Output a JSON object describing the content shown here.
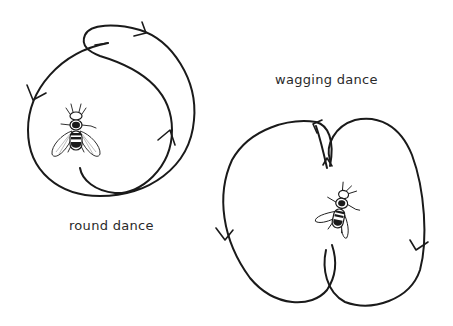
{
  "diagram": {
    "colors": {
      "line": "#1a1a1a",
      "background": "#ffffff",
      "text": "#2a2a2a"
    },
    "panels": [
      {
        "id": "round",
        "label": "round dance",
        "icon": "bee-icon",
        "description": "Circular trail with a reversing loop; arrows indicate alternating circling direction"
      },
      {
        "id": "wagging",
        "label": "wagging dance",
        "icon": "bee-icon",
        "description": "Figure-eight trail; straight central waggle run through the middle, return loops to left and right"
      }
    ]
  }
}
